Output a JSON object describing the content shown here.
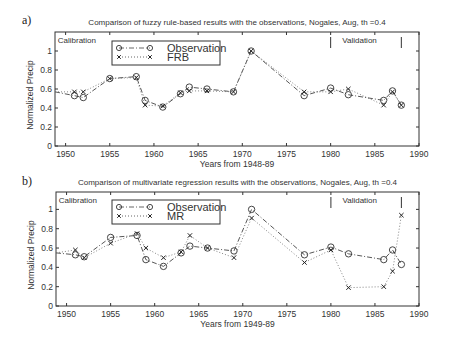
{
  "chart_data": [
    {
      "panel_label": "a)",
      "type": "line",
      "title": "Comparison of fuzzy rule-based results with the observations, Nogales, Aug, th =0.4",
      "xlabel": "Years from 1948-89",
      "ylabel": "Normalized Precip",
      "xlim": [
        1948.8,
        1990
      ],
      "ylim": [
        0,
        1.2
      ],
      "xticks": [
        1950,
        1955,
        1960,
        1965,
        1970,
        1975,
        1980,
        1985,
        1990
      ],
      "yticks": [
        0,
        0.2,
        0.4,
        0.6,
        0.8,
        1
      ],
      "grid": false,
      "legend_position": "upper-left-inside",
      "annotations": [
        {
          "text": "Calibration",
          "x": 1949.0,
          "y": 1.12
        },
        {
          "text": "Validation",
          "x": 1981.2,
          "y": 1.12
        }
      ],
      "period_markers": [
        1980,
        1988
      ],
      "x": [
        1948.8,
        1951,
        1952,
        1955,
        1958,
        1959,
        1961,
        1963,
        1964,
        1966,
        1969,
        1971,
        1977,
        1980,
        1982,
        1986,
        1987,
        1988
      ],
      "series": [
        {
          "name": "Observation",
          "style": "dash-dot",
          "marker": "circle",
          "values": [
            0.57,
            0.53,
            0.51,
            0.71,
            0.73,
            0.48,
            0.41,
            0.55,
            0.62,
            0.6,
            0.57,
            1.0,
            0.53,
            0.61,
            0.54,
            0.48,
            0.58,
            0.43
          ]
        },
        {
          "name": "FRB",
          "style": "dotted",
          "marker": "x",
          "values": [
            0.57,
            0.57,
            0.57,
            0.71,
            0.72,
            0.43,
            0.42,
            0.56,
            0.58,
            0.58,
            0.57,
            1.0,
            0.57,
            0.57,
            0.6,
            0.43,
            0.57,
            0.43
          ]
        }
      ]
    },
    {
      "panel_label": "b)",
      "type": "line",
      "title": "Comparison of multivariate regression results with the observations, Nogales, Aug, th =0.4",
      "xlabel": "Years from 1949-89",
      "ylabel": "Normalized Precip",
      "xlim": [
        1948.8,
        1990
      ],
      "ylim": [
        0,
        1.18
      ],
      "xticks": [
        1950,
        1955,
        1960,
        1965,
        1970,
        1975,
        1980,
        1985,
        1990
      ],
      "yticks": [
        0,
        0.2,
        0.4,
        0.6,
        0.8,
        1
      ],
      "grid": false,
      "legend_position": "upper-left-inside",
      "annotations": [
        {
          "text": "Calibration",
          "x": 1949.0,
          "y": 1.1
        },
        {
          "text": "Validation",
          "x": 1981.2,
          "y": 1.1
        }
      ],
      "period_markers": [
        1980,
        1988
      ],
      "x": [
        1948.8,
        1951,
        1952,
        1955,
        1958,
        1959,
        1961,
        1963,
        1964,
        1966,
        1969,
        1971,
        1977,
        1980,
        1982,
        1986,
        1987,
        1988
      ],
      "series": [
        {
          "name": "Observation",
          "style": "dash-dot",
          "marker": "circle",
          "values": [
            0.55,
            0.53,
            0.51,
            0.71,
            0.73,
            0.48,
            0.41,
            0.55,
            0.62,
            0.6,
            0.57,
            1.0,
            0.53,
            0.61,
            0.54,
            0.48,
            0.58,
            0.43
          ]
        },
        {
          "name": "MR",
          "style": "dotted",
          "marker": "x",
          "values": [
            0.55,
            0.58,
            0.5,
            0.65,
            0.75,
            0.6,
            0.5,
            0.56,
            0.73,
            0.6,
            0.5,
            0.91,
            0.45,
            0.58,
            0.19,
            0.2,
            0.36,
            0.94
          ]
        }
      ]
    }
  ],
  "layout": {
    "panels": [
      {
        "left": 55,
        "right": 419,
        "top": 32,
        "bottom": 146,
        "label_x": 22,
        "label_y": 24,
        "title_y": 25
      },
      {
        "left": 56,
        "right": 419,
        "top": 192,
        "bottom": 306,
        "label_x": 22,
        "label_y": 185,
        "title_y": 185
      }
    ],
    "legend_boxes": [
      {
        "x": 112,
        "y": 41,
        "w": 108,
        "h": 24
      },
      {
        "x": 112,
        "y": 200,
        "w": 108,
        "h": 24
      }
    ]
  }
}
